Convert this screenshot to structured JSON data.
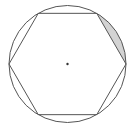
{
  "figure": {
    "center": {
      "x": 67.5,
      "y": 64
    },
    "radius": 58.5,
    "circle": {
      "stroke": "#555555",
      "stroke_width": 1
    },
    "hexagon": {
      "vertices": [
        {
          "x": 126,
          "y": 64
        },
        {
          "x": 96.75,
          "y": 13.34
        },
        {
          "x": 38.25,
          "y": 13.34
        },
        {
          "x": 9,
          "y": 64
        },
        {
          "x": 38.25,
          "y": 114.66
        },
        {
          "x": 96.75,
          "y": 114.66
        }
      ],
      "stroke": "#555555",
      "stroke_width": 1
    },
    "shaded_segment": {
      "from_vertex": {
        "x": 96.75,
        "y": 13.34
      },
      "to_vertex": {
        "x": 126,
        "y": 64
      },
      "fill": "#d3d3d3"
    },
    "center_dot": {
      "radius": 1.2,
      "fill": "#333333"
    }
  }
}
